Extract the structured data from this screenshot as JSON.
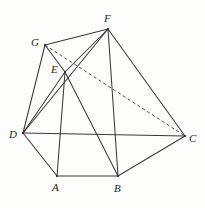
{
  "figure": {
    "type": "polyhedron-line-drawing",
    "canvas": {
      "width": 205,
      "height": 208
    },
    "background_color": "#fdfdfc",
    "line_color": "#3a3a3a",
    "dashed_line_color": "#4a4a4a"
  },
  "vertices": [
    {
      "id": "A",
      "label": "A",
      "x": 57,
      "y": 176,
      "label_x": 52,
      "label_y": 182
    },
    {
      "id": "B",
      "label": "B",
      "x": 118,
      "y": 176,
      "label_x": 114,
      "label_y": 183
    },
    {
      "id": "C",
      "label": "C",
      "x": 185,
      "y": 136,
      "label_x": 189,
      "label_y": 133
    },
    {
      "id": "D",
      "label": "D",
      "x": 23,
      "y": 133,
      "label_x": 9,
      "label_y": 129
    },
    {
      "id": "E",
      "label": "E",
      "x": 65,
      "y": 72,
      "label_x": 51,
      "label_y": 64
    },
    {
      "id": "F",
      "label": "F",
      "x": 108,
      "y": 29,
      "label_x": 104,
      "label_y": 13
    },
    {
      "id": "G",
      "label": "G",
      "x": 45,
      "y": 45,
      "label_x": 31,
      "label_y": 37
    }
  ],
  "edges": [
    {
      "from": "G",
      "to": "F",
      "style": "solid"
    },
    {
      "from": "G",
      "to": "E",
      "style": "solid"
    },
    {
      "from": "G",
      "to": "D",
      "style": "solid"
    },
    {
      "from": "G",
      "to": "C",
      "style": "dashed"
    },
    {
      "from": "F",
      "to": "E",
      "style": "solid"
    },
    {
      "from": "F",
      "to": "B",
      "style": "solid"
    },
    {
      "from": "F",
      "to": "C",
      "style": "solid"
    },
    {
      "from": "F",
      "to": "D",
      "style": "solid"
    },
    {
      "from": "E",
      "to": "D",
      "style": "solid"
    },
    {
      "from": "E",
      "to": "A",
      "style": "solid"
    },
    {
      "from": "E",
      "to": "B",
      "style": "solid"
    },
    {
      "from": "D",
      "to": "C",
      "style": "solid"
    },
    {
      "from": "D",
      "to": "A",
      "style": "solid"
    },
    {
      "from": "A",
      "to": "B",
      "style": "solid"
    },
    {
      "from": "B",
      "to": "C",
      "style": "solid"
    }
  ]
}
